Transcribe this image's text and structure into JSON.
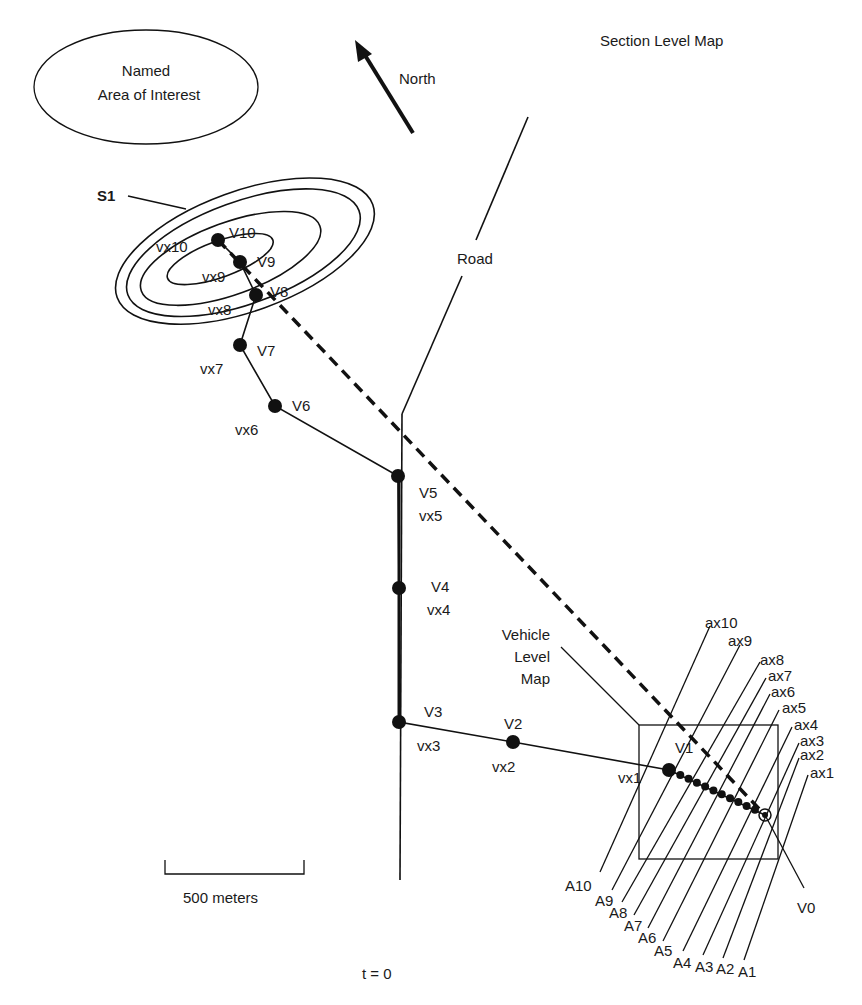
{
  "title": "Section Level Map",
  "named_area": {
    "line1": "Named",
    "line2": "Area of Interest"
  },
  "north": {
    "label": "North",
    "icon": "north-arrow-icon"
  },
  "road": {
    "label": "Road"
  },
  "s1": {
    "label": "S1"
  },
  "vehicle_map": {
    "line1": "Vehicle",
    "line2": "Level",
    "line3": "Map"
  },
  "scale": {
    "label": "500 meters"
  },
  "time": {
    "label": "t = 0"
  },
  "colors": {
    "ink": "#111111",
    "background": "#ffffff"
  },
  "waypoints": [
    {
      "id": "V10",
      "vx": "vx10",
      "x": 218,
      "y": 240
    },
    {
      "id": "V9",
      "vx": "vx9",
      "x": 240,
      "y": 262
    },
    {
      "id": "V8",
      "vx": "vx8",
      "x": 256,
      "y": 295
    },
    {
      "id": "V7",
      "vx": "vx7",
      "x": 240,
      "y": 345
    },
    {
      "id": "V6",
      "vx": "vx6",
      "x": 275,
      "y": 406
    },
    {
      "id": "V5",
      "vx": "vx5",
      "x": 398,
      "y": 476
    },
    {
      "id": "V4",
      "vx": "vx4",
      "x": 399,
      "y": 588
    },
    {
      "id": "V3",
      "vx": "vx3",
      "x": 399,
      "y": 722
    },
    {
      "id": "V2",
      "vx": "vx2",
      "x": 513,
      "y": 742
    },
    {
      "id": "V1",
      "vx": "vx1",
      "x": 669,
      "y": 770
    },
    {
      "id": "V0",
      "x": 765,
      "y": 815
    }
  ],
  "a_labels": [
    "A1",
    "A2",
    "A3",
    "A4",
    "A5",
    "A6",
    "A7",
    "A8",
    "A9",
    "A10"
  ],
  "ax_labels": [
    "ax1",
    "ax2",
    "ax3",
    "ax4",
    "ax5",
    "ax6",
    "ax7",
    "ax8",
    "ax9",
    "ax10"
  ]
}
